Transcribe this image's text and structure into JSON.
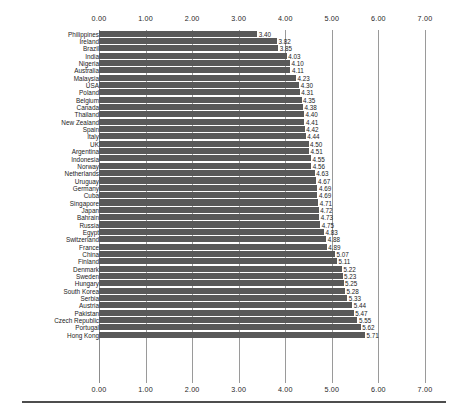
{
  "chart_data": {
    "type": "bar",
    "orientation": "horizontal",
    "title": "",
    "subtitle": "",
    "xlabel": "",
    "ylabel": "",
    "xlim": [
      0,
      7
    ],
    "xticks": [
      "0.00",
      "1.00",
      "2.00",
      "3.00",
      "4.00",
      "5.00",
      "6.00",
      "7.00"
    ],
    "xtick_values": [
      0,
      1,
      2,
      3,
      4,
      5,
      6,
      7
    ],
    "grid": true,
    "grid_axis": "x",
    "legend": null,
    "axis_positions": [
      "top",
      "bottom"
    ],
    "bar_color": "#595959",
    "value_label_format": "0.00",
    "categories": [
      "Philippines",
      "Ireland",
      "Brazil",
      "India",
      "Nigeria",
      "Australia",
      "Malaysia",
      "USA",
      "Poland",
      "Belgium",
      "Canada",
      "Thailand",
      "New Zealand",
      "Spain",
      "Italy",
      "UK",
      "Argentina",
      "Indonesia",
      "Norway",
      "Netherlands",
      "Uruguay",
      "Germany",
      "Cuba",
      "Singapore",
      "Japan",
      "Bahrain",
      "Russia",
      "Egypt",
      "Switzerland",
      "France",
      "China",
      "Finland",
      "Denmark",
      "Sweden",
      "Hungary",
      "South Korea",
      "Serbia",
      "Austria",
      "Pakistan",
      "Czech Republic",
      "Portugal",
      "Hong Kong"
    ],
    "values": [
      3.4,
      3.82,
      3.85,
      4.03,
      4.1,
      4.11,
      4.23,
      4.3,
      4.31,
      4.35,
      4.38,
      4.4,
      4.41,
      4.42,
      4.44,
      4.5,
      4.51,
      4.55,
      4.56,
      4.63,
      4.67,
      4.69,
      4.69,
      4.71,
      4.72,
      4.73,
      4.75,
      4.83,
      4.88,
      4.89,
      5.07,
      5.11,
      5.22,
      5.23,
      5.25,
      5.28,
      5.33,
      5.44,
      5.47,
      5.55,
      5.62,
      5.71
    ],
    "value_labels": [
      "3.40",
      "3.82",
      "3.85",
      "4.03",
      "4.10",
      "4.11",
      "4.23",
      "4.30",
      "4.31",
      "4.35",
      "4.38",
      "4.40",
      "4.41",
      "4.42",
      "4.44",
      "4.50",
      "4.51",
      "4.55",
      "4.56",
      "4.63",
      "4.67",
      "4.69",
      "4.69",
      "4.71",
      "4.72",
      "4.73",
      "4.75",
      "4.83",
      "4.88",
      "4.89",
      "5.07",
      "5.11",
      "5.22",
      "5.23",
      "5.25",
      "5.28",
      "5.33",
      "5.44",
      "5.47",
      "5.55",
      "5.62",
      "5.71"
    ]
  }
}
